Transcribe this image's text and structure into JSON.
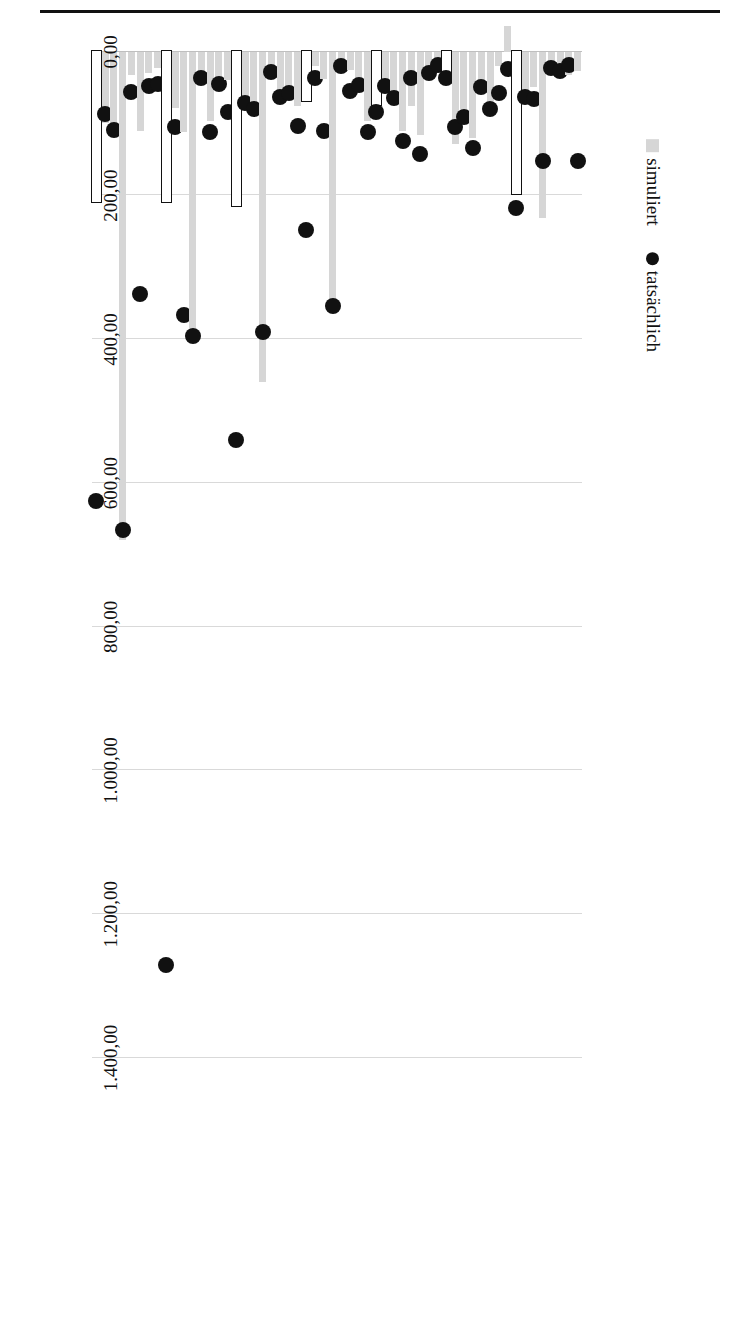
{
  "figure": {
    "orientation": "rotated-90",
    "legend": {
      "position": "below-axis-right",
      "entries": [
        {
          "key": "simuliert",
          "label": "simuliert",
          "marker": "bar-swatch",
          "color": "#d6d6d6"
        },
        {
          "key": "tatsaechlich",
          "label": "tatsächlich",
          "marker": "dot",
          "color": "#111111"
        }
      ]
    }
  },
  "chart_data": {
    "type": "bar",
    "title": "",
    "xlabel": "",
    "ylabel": "",
    "orientation": "horizontal-bars-rotated",
    "xlim": [
      -200,
      1400
    ],
    "grid": true,
    "legend_position": "bottom-right",
    "tick_labels": [
      "1.400,00",
      "1.200,00",
      "1.000,00",
      "800,00",
      "600,00",
      "400,00",
      "200,00",
      "0,00",
      "-200,00"
    ],
    "tick_values": [
      1400,
      1200,
      1000,
      800,
      600,
      400,
      200,
      0,
      -200
    ],
    "series": [
      {
        "name": "simuliert",
        "marker": "bar",
        "color": "#d6d6d6"
      },
      {
        "name": "tatsächlich",
        "marker": "dot",
        "color": "#111111"
      }
    ],
    "groups": [
      {
        "label": "Alleinerziehend, 1 Kind",
        "categories": [
          "AT",
          "ES",
          "FI",
          "LV",
          "NL",
          "SE",
          "SI",
          "DE"
        ],
        "simuliert": [
          27,
          33,
          21,
          18,
          232,
          49,
          57,
          200
        ],
        "tatsaechlich": [
          152,
          19,
          27,
          22,
          152,
          66,
          63,
          218
        ]
      },
      {
        "label": "Alleinerziehend, 2 Kinder",
        "categories": [
          "AT",
          "ES",
          "FI",
          "LV",
          "NL",
          "SE",
          "SI",
          "DE"
        ],
        "simuliert": [
          -36,
          20,
          68,
          40,
          120,
          80,
          128,
          42
        ],
        "tatsaechlich": [
          24,
          58,
          80,
          49,
          134,
          91,
          105,
          36
        ]
      },
      {
        "label": "Alleinerziehend, 3 oder mehr Kinder",
        "categories": [
          "AT",
          "ES",
          "FI",
          "LV",
          "NL",
          "SE",
          "SI",
          "DE"
        ],
        "simuliert": [
          17,
          32,
          116,
          76,
          110,
          66,
          53,
          75
        ],
        "tatsaechlich": [
          18,
          30,
          142,
          36,
          124,
          64,
          47,
          84
        ]
      },
      {
        "label": "Paar, keine Kinder",
        "categories": [
          "AT",
          "ES",
          "FI",
          "LV",
          "NL",
          "SE",
          "SI",
          "DE"
        ],
        "simuliert": [
          97,
          36,
          26,
          13,
          356,
          38,
          20,
          70
        ],
        "tatsaechlich": [
          112,
          46,
          54,
          20,
          354,
          110,
          36,
          248
        ]
      },
      {
        "label": "Paar, 1 Kind",
        "categories": [
          "AT",
          "ES",
          "FI",
          "LV",
          "NL",
          "SE",
          "SI",
          "DE"
        ],
        "simuliert": [
          76,
          54,
          57,
          25,
          460,
          90,
          72,
          216
        ],
        "tatsaechlich": [
          103,
          57,
          63,
          28,
          390,
          79,
          71,
          540
        ]
      },
      {
        "label": "Paar, 2 Kinder",
        "categories": [
          "AT",
          "ES",
          "FI",
          "LV",
          "NL",
          "SE",
          "SI",
          "DE"
        ],
        "simuliert": [
          39,
          36,
          97,
          44,
          385,
          112,
          78,
          210
        ],
        "tatsaechlich": [
          84,
          45,
          111,
          36,
          395,
          366,
          105,
          1270
        ]
      },
      {
        "label": "Paar, drei oder mehr Kinder",
        "categories": [
          "AT",
          "ES",
          "FI",
          "LV",
          "NL",
          "SE",
          "SI",
          "DE"
        ],
        "simuliert": [
          22,
          30,
          110,
          32,
          679,
          101,
          99,
          210
        ],
        "tatsaechlich": [
          45,
          47,
          337,
          56,
          665,
          109,
          87,
          625
        ]
      }
    ]
  }
}
